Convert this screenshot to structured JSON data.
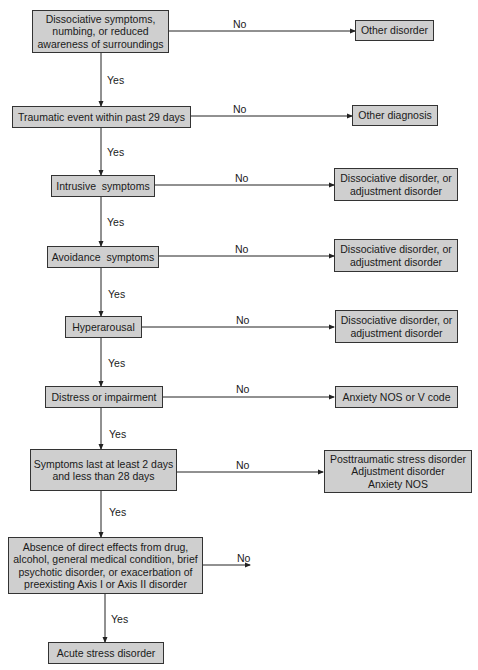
{
  "flowchart": {
    "nodes": [
      {
        "id": "dissociative-symptoms",
        "lines": [
          "Dissociative symptoms,",
          "numbing, or reduced",
          "awareness of surroundings"
        ]
      },
      {
        "id": "traumatic-event",
        "lines": [
          "Traumatic event within past 29 days"
        ]
      },
      {
        "id": "intrusive-symptoms",
        "lines": [
          "Intrusive  symptoms"
        ]
      },
      {
        "id": "avoidance-symptoms",
        "lines": [
          "Avoidance  symptoms"
        ]
      },
      {
        "id": "hyperarousal",
        "lines": [
          "Hyperarousal"
        ]
      },
      {
        "id": "distress-impairment",
        "lines": [
          "Distress or impairment"
        ]
      },
      {
        "id": "duration",
        "lines": [
          "Symptoms last at least 2 days",
          "and less than 28 days"
        ]
      },
      {
        "id": "absence-direct-effects",
        "lines": [
          "Absence of direct effects from drug,",
          "alcohol, general medical condition, brief",
          "psychotic disorder, or exacerbation of",
          "preexisting Axis I or Axis II disorder"
        ]
      },
      {
        "id": "acute-stress-disorder",
        "lines": [
          "Acute stress disorder"
        ]
      }
    ],
    "outcomes": [
      {
        "id": "other-disorder",
        "lines": [
          "Other disorder"
        ]
      },
      {
        "id": "other-diagnosis",
        "lines": [
          "Other diagnosis"
        ]
      },
      {
        "id": "dissociative-or-adjustment-1",
        "lines": [
          "Dissociative disorder, or",
          "adjustment disorder"
        ]
      },
      {
        "id": "dissociative-or-adjustment-2",
        "lines": [
          "Dissociative disorder, or",
          "adjustment disorder"
        ]
      },
      {
        "id": "dissociative-or-adjustment-3",
        "lines": [
          "Dissociative disorder, or",
          "adjustment disorder"
        ]
      },
      {
        "id": "anxiety-nos-or-v-code",
        "lines": [
          "Anxiety NOS or V code"
        ]
      },
      {
        "id": "ptsd-adjustment-anxiety",
        "lines": [
          "Posttraumatic stress disorder",
          "Adjustment disorder",
          "Anxiety NOS"
        ]
      }
    ],
    "edge_labels": {
      "yes": "Yes",
      "no": "No"
    },
    "colors": {
      "box_fill": "#cfcfcf",
      "box_border": "#333333",
      "line": "#222222"
    }
  }
}
